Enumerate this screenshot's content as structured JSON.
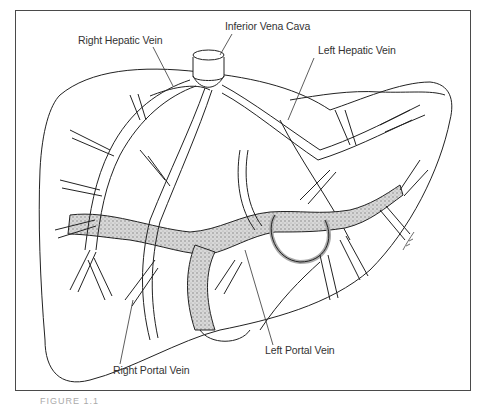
{
  "figure": {
    "labels": {
      "ivc": "Inferior Vena Cava",
      "right_hepatic_vein": "Right Hepatic Vein",
      "left_hepatic_vein": "Left Hepatic Vein",
      "left_portal_vein": "Left Portal Vein",
      "right_portal_vein": "Right Portal Vein"
    },
    "caption_fragment": "FIGURE 1.1",
    "artist_signature": "signature",
    "colors": {
      "frame": "#4a4a4a",
      "line": "#222222",
      "portal_stipple": "#9a9a9a",
      "label_text": "#333333"
    }
  }
}
